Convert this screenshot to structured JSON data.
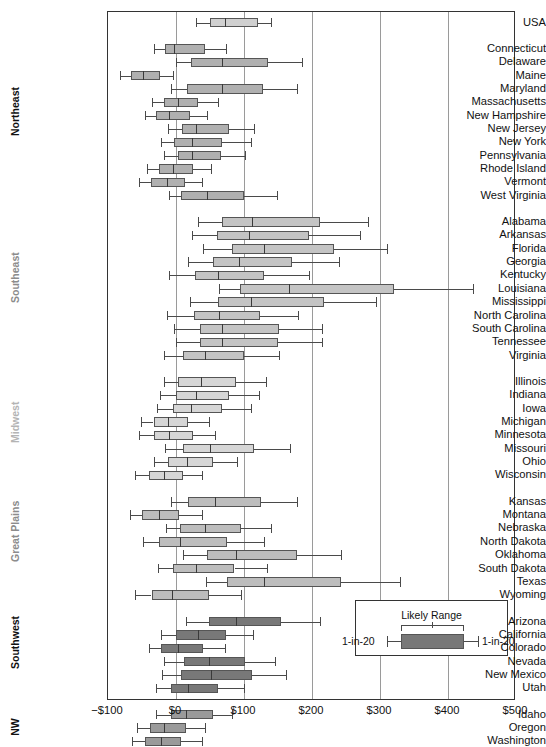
{
  "axis": {
    "x_ticks": [
      "−$100",
      "$0",
      "$100",
      "$200",
      "$300",
      "$400",
      "$500"
    ],
    "x_tick_values": [
      -100,
      0,
      100,
      200,
      300,
      400,
      500
    ],
    "xmin": -100,
    "xmax": 500,
    "gridlines": [
      0,
      100,
      200,
      300,
      400
    ]
  },
  "legend": {
    "title": "Likely Range",
    "left_label": "1-in-20",
    "right_label": "1-in-20"
  },
  "regions": [
    {
      "name": "",
      "color": "#111111"
    },
    {
      "name": "Northeast",
      "color": "#111111"
    },
    {
      "name": "Southeast",
      "color": "#8c8c8c"
    },
    {
      "name": "Midwest",
      "color": "#b4b4b4"
    },
    {
      "name": "Great Plains",
      "color": "#8c8c8c"
    },
    {
      "name": "Southwest",
      "color": "#111111"
    },
    {
      "name": "NW",
      "color": "#111111"
    }
  ],
  "chart_data": {
    "type": "boxplot",
    "title": "",
    "xlabel": "",
    "ylabel": "",
    "xlim": [
      -100,
      500
    ],
    "grid": true,
    "legend_position": "bottom-right",
    "orientation": "horizontal",
    "series": [
      {
        "region": "",
        "fill": "#d0d0d0",
        "rows": [
          {
            "name": "USA",
            "low": 30,
            "q1": 50,
            "median": 72,
            "q3": 120,
            "high": 140
          }
        ]
      },
      {
        "region": "Northeast",
        "fill": "#b0b0b0",
        "rows": [
          {
            "name": "Connecticut",
            "low": -32,
            "q1": -16,
            "median": -3,
            "q3": 43,
            "high": 73
          },
          {
            "name": "Delaware",
            "low": 0,
            "q1": 22,
            "median": 68,
            "q3": 135,
            "high": 185
          },
          {
            "name": "Maine",
            "low": -83,
            "q1": -66,
            "median": -48,
            "q3": -23,
            "high": -5
          },
          {
            "name": "Maryland",
            "low": -8,
            "q1": 16,
            "median": 67,
            "q3": 128,
            "high": 178
          },
          {
            "name": "Massachusetts",
            "low": -35,
            "q1": -18,
            "median": 3,
            "q3": 33,
            "high": 62
          },
          {
            "name": "New Hampshire",
            "low": -45,
            "q1": -30,
            "median": -10,
            "q3": 20,
            "high": 45
          },
          {
            "name": "New Jersey",
            "low": -12,
            "q1": 9,
            "median": 30,
            "q3": 78,
            "high": 114
          },
          {
            "name": "New York",
            "low": -22,
            "q1": -3,
            "median": 23,
            "q3": 68,
            "high": 110
          },
          {
            "name": "Pennsylvania",
            "low": -17,
            "q1": 3,
            "median": 24,
            "q3": 66,
            "high": 102
          },
          {
            "name": "Rhode Island",
            "low": -42,
            "q1": -25,
            "median": -5,
            "q3": 25,
            "high": 52
          },
          {
            "name": "Vermont",
            "low": -55,
            "q1": -37,
            "median": -13,
            "q3": 13,
            "high": 38
          },
          {
            "name": "West Virginia",
            "low": -10,
            "q1": 8,
            "median": 45,
            "q3": 100,
            "high": 148
          }
        ]
      },
      {
        "region": "Southeast",
        "fill": "#c4c4c4",
        "rows": [
          {
            "name": "Alabama",
            "low": 33,
            "q1": 68,
            "median": 112,
            "q3": 212,
            "high": 283
          },
          {
            "name": "Arkansas",
            "low": 24,
            "q1": 60,
            "median": 108,
            "q3": 196,
            "high": 270
          },
          {
            "name": "Florida",
            "low": 40,
            "q1": 83,
            "median": 130,
            "q3": 232,
            "high": 310
          },
          {
            "name": "Georgia",
            "low": 18,
            "q1": 55,
            "median": 92,
            "q3": 170,
            "high": 240
          },
          {
            "name": "Kentucky",
            "low": -10,
            "q1": 28,
            "median": 62,
            "q3": 130,
            "high": 196
          },
          {
            "name": "Louisiana",
            "low": 63,
            "q1": 94,
            "median": 166,
            "q3": 320,
            "high": 437
          },
          {
            "name": "Mississippi",
            "low": 20,
            "q1": 62,
            "median": 110,
            "q3": 218,
            "high": 294
          },
          {
            "name": "North Carolina",
            "low": -13,
            "q1": 26,
            "median": 63,
            "q3": 124,
            "high": 180
          },
          {
            "name": "South Carolina",
            "low": -3,
            "q1": 35,
            "median": 68,
            "q3": 152,
            "high": 215
          },
          {
            "name": "Tennessee",
            "low": 0,
            "q1": 35,
            "median": 68,
            "q3": 150,
            "high": 215
          },
          {
            "name": "Virginia",
            "low": -18,
            "q1": 10,
            "median": 42,
            "q3": 100,
            "high": 152
          }
        ]
      },
      {
        "region": "Midwest",
        "fill": "#d6d6d6",
        "rows": [
          {
            "name": "Illinois",
            "low": -18,
            "q1": 3,
            "median": 37,
            "q3": 88,
            "high": 132
          },
          {
            "name": "Indiana",
            "low": -23,
            "q1": 0,
            "median": 30,
            "q3": 78,
            "high": 122
          },
          {
            "name": "Iowa",
            "low": -28,
            "q1": -4,
            "median": 22,
            "q3": 68,
            "high": 110
          },
          {
            "name": "Michigan",
            "low": -52,
            "q1": -33,
            "median": -12,
            "q3": 18,
            "high": 48
          },
          {
            "name": "Minnesota",
            "low": -54,
            "q1": -32,
            "median": -10,
            "q3": 25,
            "high": 57
          },
          {
            "name": "Missouri",
            "low": -16,
            "q1": 10,
            "median": 50,
            "q3": 115,
            "high": 168
          },
          {
            "name": "Ohio",
            "low": -32,
            "q1": -12,
            "median": 16,
            "q3": 55,
            "high": 90
          },
          {
            "name": "Wisconsin",
            "low": -60,
            "q1": -40,
            "median": -18,
            "q3": 10,
            "high": 38
          }
        ]
      },
      {
        "region": "Great Plains",
        "fill": "#bdbdbd",
        "rows": [
          {
            "name": "Kansas",
            "low": -8,
            "q1": 18,
            "median": 58,
            "q3": 125,
            "high": 178
          },
          {
            "name": "Montana",
            "low": -68,
            "q1": -50,
            "median": -25,
            "q3": 5,
            "high": 38
          },
          {
            "name": "Nebraska",
            "low": -15,
            "q1": 6,
            "median": 42,
            "q3": 95,
            "high": 140
          },
          {
            "name": "North Dakota",
            "low": -48,
            "q1": -25,
            "median": 6,
            "q3": 75,
            "high": 130
          },
          {
            "name": "Oklahoma",
            "low": 10,
            "q1": 45,
            "median": 88,
            "q3": 178,
            "high": 242
          },
          {
            "name": "South Dakota",
            "low": -27,
            "q1": -4,
            "median": 30,
            "q3": 86,
            "high": 134
          },
          {
            "name": "Texas",
            "low": 44,
            "q1": 75,
            "median": 130,
            "q3": 243,
            "high": 330
          },
          {
            "name": "Wyoming",
            "low": -60,
            "q1": -36,
            "median": -6,
            "q3": 48,
            "high": 95
          }
        ]
      },
      {
        "region": "Southwest",
        "fill": "#787878",
        "rows": [
          {
            "name": "Arizona",
            "low": 15,
            "q1": 48,
            "median": 88,
            "q3": 155,
            "high": 212
          },
          {
            "name": "California",
            "low": -22,
            "q1": 0,
            "median": 32,
            "q3": 73,
            "high": 113
          },
          {
            "name": "Colorado",
            "low": -40,
            "q1": -22,
            "median": 3,
            "q3": 40,
            "high": 72
          },
          {
            "name": "Nevada",
            "low": -18,
            "q1": 12,
            "median": 48,
            "q3": 102,
            "high": 145
          },
          {
            "name": "New Mexico",
            "low": -20,
            "q1": 8,
            "median": 52,
            "q3": 112,
            "high": 162
          },
          {
            "name": "Utah",
            "low": -30,
            "q1": -8,
            "median": 18,
            "q3": 62,
            "high": 100
          }
        ]
      },
      {
        "region": "NW",
        "fill": "#9a9a9a",
        "rows": [
          {
            "name": "Idaho",
            "low": -30,
            "q1": -8,
            "median": 15,
            "q3": 55,
            "high": 82
          },
          {
            "name": "Oregon",
            "low": -57,
            "q1": -38,
            "median": -18,
            "q3": 15,
            "high": 42
          },
          {
            "name": "Washington",
            "low": -65,
            "q1": -45,
            "median": -22,
            "q3": 8,
            "high": 38
          }
        ]
      }
    ]
  }
}
